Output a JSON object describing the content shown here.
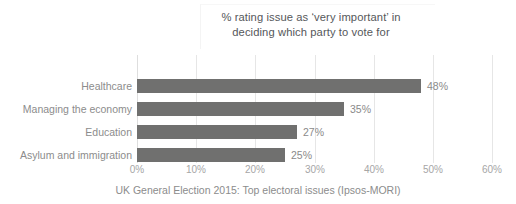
{
  "chart_data": {
    "type": "bar",
    "orientation": "horizontal",
    "title": "% rating issue as ‘very important’ in deciding which party to vote for",
    "title_lines": [
      "% rating issue as ‘very important’ in",
      "deciding which party to vote for"
    ],
    "caption": "UK General Election 2015: Top electoral issues (Ipsos-MORI)",
    "categories": [
      "Healthcare",
      "Managing the economy",
      "Education",
      "Asylum and immigration"
    ],
    "values": [
      48,
      35,
      27,
      25
    ],
    "data_labels": [
      "48%",
      "35%",
      "27%",
      "25%"
    ],
    "xlabel": "",
    "ylabel": "",
    "xlim": [
      0,
      60
    ],
    "xtick_values": [
      0,
      10,
      20,
      30,
      40,
      50,
      60
    ],
    "xtick_labels": [
      "0%",
      "10%",
      "20%",
      "30%",
      "40%",
      "50%",
      "60%"
    ],
    "grid": "vertical",
    "legend": "none",
    "colors": {
      "bar": "#70706f",
      "gridline": "#e6e6e6",
      "title_text": "#55575a",
      "category_text": "#8c8c8c",
      "value_text": "#8a8a8a",
      "tick_text": "#a6a6a6",
      "caption_text": "#8c8c8c",
      "background": "#ffffff"
    }
  }
}
